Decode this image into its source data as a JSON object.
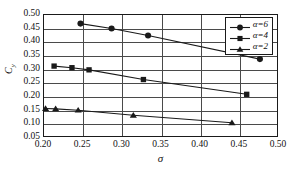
{
  "chart_data": {
    "type": "line",
    "title": "",
    "xlabel": "σ",
    "ylabel": "Cᵧ",
    "ylabel_base": "C",
    "ylabel_sub": "y",
    "xlim": [
      0.2,
      0.5
    ],
    "ylim": [
      0.05,
      0.5
    ],
    "xticks": [
      "0.20",
      "0.25",
      "0.30",
      "0.35",
      "0.40",
      "0.45",
      "0.50"
    ],
    "yticks": [
      "0.05",
      "0.10",
      "0.15",
      "0.20",
      "0.25",
      "0.30",
      "0.35",
      "0.40",
      "0.45",
      "0.50"
    ],
    "grid": true,
    "legend_position": "top-right",
    "line_color": "#1a1a1a",
    "marker_color": "#1a1a1a",
    "grid_color": "#4a4a4a",
    "series": [
      {
        "name": "α=6",
        "marker": "circle",
        "x": [
          0.247,
          0.287,
          0.334,
          0.478
        ],
        "y": [
          0.468,
          0.45,
          0.424,
          0.336
        ]
      },
      {
        "name": "α=4",
        "marker": "square",
        "x": [
          0.213,
          0.236,
          0.258,
          0.328,
          0.461
        ],
        "y": [
          0.31,
          0.304,
          0.296,
          0.26,
          0.205
        ]
      },
      {
        "name": "α=2",
        "marker": "triangle",
        "x": [
          0.202,
          0.215,
          0.244,
          0.315,
          0.442
        ],
        "y": [
          0.152,
          0.151,
          0.146,
          0.127,
          0.099
        ]
      }
    ]
  },
  "legend": {
    "entries": [
      {
        "label": "α=6",
        "marker": "circle"
      },
      {
        "label": "α=4",
        "marker": "square"
      },
      {
        "label": "α=2",
        "marker": "triangle"
      }
    ]
  }
}
